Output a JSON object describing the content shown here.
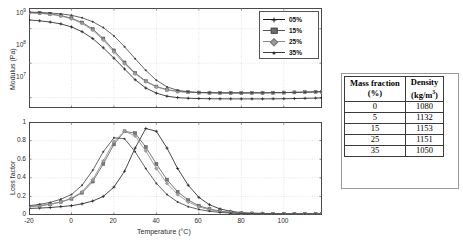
{
  "figure": {
    "background": "#ffffff"
  },
  "legend": {
    "position": "top-right",
    "entries": [
      {
        "label": "05%",
        "color": "#1a1a1a",
        "marker": "plus"
      },
      {
        "label": "15%",
        "color": "#555555",
        "marker": "square"
      },
      {
        "label": "25%",
        "color": "#8a8a8a",
        "marker": "diamond"
      },
      {
        "label": "35%",
        "color": "#3d3d3d",
        "marker": "dot"
      }
    ]
  },
  "table": {
    "headers": [
      {
        "line1": "Mass fraction",
        "line2": "(%)"
      },
      {
        "line1": "Density",
        "line2": "(kg/m",
        "sup": "3",
        "line2_end": ")"
      }
    ],
    "rows": [
      {
        "mass_fraction": "0",
        "density": "1080"
      },
      {
        "mass_fraction": "5",
        "density": "1132"
      },
      {
        "mass_fraction": "15",
        "density": "1153"
      },
      {
        "mass_fraction": "25",
        "density": "1151"
      },
      {
        "mass_fraction": "35",
        "density": "1050"
      }
    ]
  },
  "chart_data": [
    {
      "type": "line",
      "id": "modulus",
      "title": "",
      "xlabel": "",
      "ylabel": "Modulus (Pa)",
      "yscale": "log",
      "xlim": [
        -20,
        118
      ],
      "ylim": [
        5000000,
        4000000000
      ],
      "grid": true,
      "xticks": [
        -20,
        0,
        20,
        40,
        60,
        80,
        100
      ],
      "xticklabels": [
        "",
        "",
        "",
        "",
        "",
        "",
        ""
      ],
      "yticks": [
        10000000,
        100000000,
        1000000000
      ],
      "yticklabels": [
        "10⁷",
        "10⁸",
        "10⁹"
      ],
      "x": [
        -20,
        -15,
        -10,
        -5,
        0,
        5,
        10,
        15,
        20,
        25,
        30,
        35,
        40,
        45,
        50,
        55,
        60,
        65,
        70,
        75,
        80,
        85,
        90,
        95,
        100,
        105,
        110,
        115,
        118
      ],
      "series": [
        {
          "name": "05%",
          "color": "#1a1a1a",
          "marker": "plus",
          "values": [
            1800000000,
            1700000000,
            1560000000,
            1380000000,
            1130000000,
            820000000,
            520000000,
            280000000,
            140000000,
            68000000,
            33000000,
            19000000,
            13500000,
            11000000,
            10000000,
            9600000,
            9400000,
            9300000,
            9250000,
            9220000,
            9200000,
            9200000,
            9200000,
            9250000,
            9300000,
            9400000,
            9550000,
            9700000,
            9800000
          ]
        },
        {
          "name": "15%",
          "color": "#555555",
          "marker": "square",
          "values": [
            2950000000,
            2850000000,
            2680000000,
            2420000000,
            2020000000,
            1520000000,
            980000000,
            520000000,
            235000000,
            105000000,
            52000000,
            30000000,
            21000000,
            17000000,
            15200000,
            14400000,
            14000000,
            13800000,
            13700000,
            13700000,
            13700000,
            13750000,
            13800000,
            13900000,
            14000000,
            14200000,
            14400000,
            14700000,
            14900000
          ]
        },
        {
          "name": "25%",
          "color": "#8a8a8a",
          "marker": "diamond",
          "values": [
            2900000000,
            2800000000,
            2620000000,
            2340000000,
            1930000000,
            1430000000,
            900000000,
            470000000,
            210000000,
            96000000,
            49000000,
            29000000,
            20500000,
            16800000,
            15100000,
            14300000,
            13950000,
            13800000,
            13700000,
            13700000,
            13700000,
            13750000,
            13800000,
            13900000,
            14000000,
            14200000,
            14400000,
            14700000,
            14900000
          ]
        },
        {
          "name": "35%",
          "color": "#3d3d3d",
          "marker": "dot",
          "values": [
            3050000000,
            2980000000,
            2870000000,
            2700000000,
            2450000000,
            2080000000,
            1600000000,
            1080000000,
            620000000,
            300000000,
            135000000,
            62000000,
            32000000,
            20500000,
            16300000,
            14800000,
            14200000,
            13950000,
            13800000,
            13750000,
            13720000,
            13750000,
            13800000,
            13900000,
            14000000,
            14200000,
            14400000,
            14700000,
            14900000
          ]
        }
      ]
    },
    {
      "type": "line",
      "id": "loss-factor",
      "title": "",
      "xlabel": "Temperature (°C)",
      "ylabel": "Loss factor",
      "yscale": "linear",
      "xlim": [
        -20,
        118
      ],
      "ylim": [
        0,
        1
      ],
      "grid": true,
      "xticks": [
        -20,
        0,
        20,
        40,
        60,
        80,
        100
      ],
      "xticklabels": [
        "-20",
        "0",
        "20",
        "40",
        "60",
        "80",
        "100"
      ],
      "yticks": [
        0,
        0.2,
        0.4,
        0.6,
        0.8,
        1
      ],
      "yticklabels": [
        "0",
        "0.2",
        "0.4",
        "0.6",
        "0.8",
        "1"
      ],
      "x": [
        -20,
        -15,
        -10,
        -5,
        0,
        5,
        10,
        15,
        20,
        25,
        30,
        35,
        40,
        45,
        50,
        55,
        60,
        65,
        70,
        75,
        80,
        85,
        90,
        95,
        100,
        105,
        110,
        115,
        118
      ],
      "series": [
        {
          "name": "05%",
          "color": "#1a1a1a",
          "marker": "plus",
          "values": [
            0.07,
            0.075,
            0.08,
            0.09,
            0.1,
            0.12,
            0.15,
            0.2,
            0.3,
            0.47,
            0.72,
            0.93,
            0.9,
            0.72,
            0.5,
            0.32,
            0.19,
            0.11,
            0.065,
            0.04,
            0.025,
            0.02,
            0.018,
            0.015,
            0.014,
            0.013,
            0.012,
            0.012,
            0.012
          ]
        },
        {
          "name": "15%",
          "color": "#555555",
          "marker": "square",
          "values": [
            0.09,
            0.1,
            0.115,
            0.14,
            0.175,
            0.24,
            0.36,
            0.55,
            0.76,
            0.9,
            0.88,
            0.73,
            0.55,
            0.38,
            0.25,
            0.16,
            0.1,
            0.065,
            0.042,
            0.028,
            0.02,
            0.016,
            0.014,
            0.013,
            0.012,
            0.012,
            0.011,
            0.011,
            0.011
          ]
        },
        {
          "name": "25%",
          "color": "#8a8a8a",
          "marker": "diamond",
          "values": [
            0.09,
            0.1,
            0.115,
            0.14,
            0.18,
            0.25,
            0.38,
            0.58,
            0.79,
            0.9,
            0.85,
            0.69,
            0.5,
            0.34,
            0.22,
            0.14,
            0.088,
            0.057,
            0.038,
            0.026,
            0.019,
            0.016,
            0.014,
            0.013,
            0.012,
            0.012,
            0.011,
            0.011,
            0.011
          ]
        },
        {
          "name": "35%",
          "color": "#3d3d3d",
          "marker": "dot",
          "values": [
            0.1,
            0.115,
            0.135,
            0.17,
            0.22,
            0.32,
            0.48,
            0.68,
            0.83,
            0.82,
            0.68,
            0.5,
            0.34,
            0.22,
            0.14,
            0.09,
            0.06,
            0.04,
            0.028,
            0.02,
            0.016,
            0.014,
            0.013,
            0.012,
            0.011,
            0.011,
            0.011,
            0.011,
            0.011
          ]
        }
      ]
    }
  ]
}
